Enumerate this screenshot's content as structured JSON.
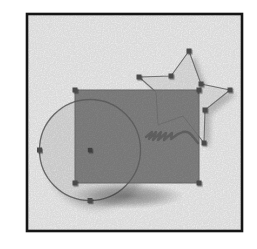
{
  "canvas": {
    "width": 257,
    "height": 249,
    "background": "#ffffff",
    "description": "drawing-canvas-with-selected-shapes"
  },
  "palette": {
    "frame_border": "#151515",
    "rectangle_fill": "#8c8c8c",
    "rectangle_stroke": "#747474",
    "circle_fill": "#ebebeb",
    "circle_stroke": "#9a9a9a",
    "star_fill": "#f0f0f0",
    "star_stroke": "#8f8f8f",
    "handle_fill": "#555555",
    "shadow_gray": "#9a9a9a"
  },
  "elements": [
    {
      "type": "circle",
      "name": "circle-drop-shadow",
      "interactable": false,
      "attrs": {
        "cx": 97,
        "cy": 158,
        "r": 50.5,
        "fill": "#9a9a9a",
        "opacity": 0.45,
        "filter": "url(#blur3)"
      }
    },
    {
      "type": "circle",
      "name": "circle-shape",
      "interactable": true,
      "attrs": {
        "cx": 90,
        "cy": 150,
        "r": 50.5,
        "fill": "#ebebeb",
        "stroke": "#9a9a9a",
        "stroke-width": 1.2
      }
    },
    {
      "type": "ellipse",
      "name": "rectangle-cast-shadow",
      "interactable": false,
      "attrs": {
        "cx": 127,
        "cy": 196,
        "rx": 57,
        "ry": 13,
        "fill": "url(#fadeGray)"
      }
    },
    {
      "type": "polygon",
      "name": "star-drop-shadow",
      "interactable": false,
      "attrs": {
        "points": "195,56 207,89 236,95 211,115 210,148 189,121 164,130 162,97 145,82 177,81",
        "fill": "#a3a3a3",
        "opacity": 0.5,
        "filter": "url(#blur2)"
      }
    },
    {
      "type": "polygon",
      "name": "star-shape",
      "interactable": true,
      "attrs": {
        "points": "189,51 201,84 230,90 205,110 204,143 183,116 158,125 156,92 139,77 171,76",
        "fill": "#f0f0f0",
        "stroke": "#8f8f8f",
        "stroke-width": 1.1,
        "stroke-linejoin": "round"
      }
    },
    {
      "type": "rect",
      "name": "rectangle-shape",
      "interactable": true,
      "attrs": {
        "x": 75,
        "y": 90,
        "width": 124,
        "height": 93,
        "fill": "#8c8c8c",
        "stroke": "#747474",
        "stroke-width": 1
      }
    },
    {
      "type": "circle",
      "name": "circle-outline-overlay",
      "interactable": false,
      "attrs": {
        "cx": 90,
        "cy": 150,
        "r": 50.5,
        "fill": "none",
        "stroke": "rgba(25,25,25,0.28)",
        "stroke-width": 1.3
      }
    },
    {
      "type": "polygon",
      "name": "star-outline-overlay",
      "interactable": false,
      "attrs": {
        "points": "189,51 201,84 230,90 205,110 204,143 183,116 158,125 156,92 139,77 171,76",
        "fill": "none",
        "stroke": "rgba(25,25,25,0.13)",
        "stroke-width": 1,
        "stroke-linejoin": "round"
      }
    },
    {
      "type": "path",
      "name": "scribble-mark",
      "interactable": false,
      "attrs": {
        "d": "M146,137 l6,-5 -3,7 7,-7 -3,8 8,-8 -3,8 8,-7 -2,7 8,-7 -1,6 7,-5 5,-2 c5,-1 7,1 11,6 l4,5",
        "fill": "none",
        "stroke": "#4e4e4e",
        "stroke-width": 2.4,
        "opacity": 0.5,
        "stroke-linecap": "round",
        "stroke-linejoin": "round"
      }
    },
    {
      "type": "rect",
      "name": "circle-center-handle",
      "interactable": true,
      "attrs": {
        "x": 87.8,
        "y": 147.8,
        "width": 4.5,
        "height": 4.5,
        "fill": "#4a4a4a",
        "filter": "url(#handleShadow)"
      }
    },
    {
      "type": "rect",
      "name": "rectangle-handle-top-left",
      "interactable": true,
      "attrs": {
        "x": 72.5,
        "y": 87.5,
        "width": 5,
        "height": 5,
        "fill": "#555555",
        "filter": "url(#handleShadow)"
      }
    },
    {
      "type": "rect",
      "name": "rectangle-handle-top-right",
      "interactable": true,
      "attrs": {
        "x": 196.5,
        "y": 87.5,
        "width": 5,
        "height": 5,
        "fill": "#555555",
        "filter": "url(#handleShadow)"
      }
    },
    {
      "type": "rect",
      "name": "rectangle-handle-bottom-left",
      "interactable": true,
      "attrs": {
        "x": 72.5,
        "y": 180.5,
        "width": 5,
        "height": 5,
        "fill": "#555555",
        "filter": "url(#handleShadow)"
      }
    },
    {
      "type": "rect",
      "name": "rectangle-handle-bottom-right",
      "interactable": true,
      "attrs": {
        "x": 196.5,
        "y": 180.5,
        "width": 5,
        "height": 5,
        "fill": "#555555",
        "filter": "url(#handleShadow)"
      }
    },
    {
      "type": "rect",
      "name": "star-handle-top-point",
      "interactable": true,
      "attrs": {
        "x": 186.5,
        "y": 48.5,
        "width": 5,
        "height": 5,
        "fill": "#555555",
        "filter": "url(#handleShadow)"
      }
    },
    {
      "type": "rect",
      "name": "star-handle-inner-left",
      "interactable": true,
      "attrs": {
        "x": 168.5,
        "y": 73.5,
        "width": 5,
        "height": 5,
        "fill": "#555555",
        "filter": "url(#handleShadow)"
      }
    },
    {
      "type": "rect",
      "name": "star-handle-left-point",
      "interactable": true,
      "attrs": {
        "x": 136.5,
        "y": 74.5,
        "width": 5,
        "height": 5,
        "fill": "#555555",
        "filter": "url(#handleShadow)"
      }
    },
    {
      "type": "rect",
      "name": "star-handle-inner-right",
      "interactable": true,
      "attrs": {
        "x": 198.5,
        "y": 81.5,
        "width": 5,
        "height": 5,
        "fill": "#555555",
        "filter": "url(#handleShadow)"
      }
    },
    {
      "type": "rect",
      "name": "star-handle-right-point",
      "interactable": true,
      "attrs": {
        "x": 227.5,
        "y": 87.5,
        "width": 5,
        "height": 5,
        "fill": "#555555",
        "filter": "url(#handleShadow)"
      }
    },
    {
      "type": "rect",
      "name": "star-handle-inner-bottom-right",
      "interactable": true,
      "attrs": {
        "x": 202.5,
        "y": 107.5,
        "width": 5,
        "height": 5,
        "fill": "#555555",
        "filter": "url(#handleShadow)"
      }
    },
    {
      "type": "rect",
      "name": "star-handle-bottom-right-point",
      "interactable": true,
      "attrs": {
        "x": 201.5,
        "y": 140.5,
        "width": 5,
        "height": 5,
        "fill": "#555555",
        "filter": "url(#handleShadow)"
      }
    },
    {
      "type": "rect",
      "name": "circle-handle-left",
      "interactable": true,
      "attrs": {
        "x": 37,
        "y": 147.5,
        "width": 5,
        "height": 5,
        "fill": "#555555",
        "filter": "url(#handleShadow)"
      }
    },
    {
      "type": "rect",
      "name": "circle-handle-bottom",
      "interactable": true,
      "attrs": {
        "x": 87.5,
        "y": 198,
        "width": 5,
        "height": 5,
        "fill": "#555555",
        "filter": "url(#handleShadow)"
      }
    },
    {
      "type": "rect",
      "name": "scan-grain-overlay",
      "interactable": false,
      "attrs": {
        "x": 28,
        "y": 15,
        "width": 213,
        "height": 215,
        "filter": "url(#noise)",
        "opacity": 0.14
      }
    },
    {
      "type": "rect",
      "name": "frame-border",
      "interactable": false,
      "attrs": {
        "x": 27,
        "y": 14,
        "width": 215,
        "height": 217,
        "fill": "none",
        "stroke": "#151515",
        "stroke-width": 2.6
      }
    }
  ]
}
